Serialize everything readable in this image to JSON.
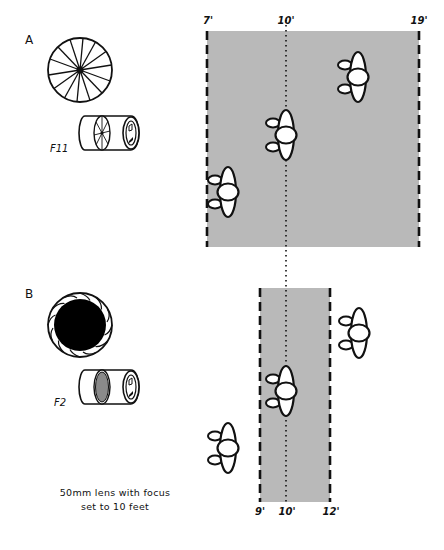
{
  "colors": {
    "background": "#ffffff",
    "depth_of_field_fill": "#b9b9b9",
    "ink": "#111111",
    "aperture_wide_fill": "#000000",
    "lens_element_fill": "#8a8a8a"
  },
  "diagram": {
    "title_caption_line1": "50mm lens with focus",
    "title_caption_line2": "set to 10 feet",
    "focus_distance_label": "10'",
    "sections": [
      {
        "id": "A",
        "label": "A",
        "aperture": "F11",
        "aperture_icon": "aperture-closed-icon",
        "lens_icon": "lens-barrel-icon",
        "dof_near_label": "7'",
        "dof_far_label": "19'",
        "focus_label": "10'",
        "people_in_focus": 3
      },
      {
        "id": "B",
        "label": "B",
        "aperture": "F2",
        "aperture_icon": "aperture-open-icon",
        "lens_icon": "lens-barrel-icon",
        "dof_near_label": "9'",
        "dof_far_label": "12'",
        "focus_label": "10'",
        "people_in_focus": 1
      }
    ]
  }
}
